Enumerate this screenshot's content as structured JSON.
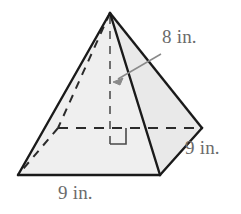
{
  "figure": {
    "type": "square-pyramid-diagram",
    "shape_name": "square pyramid",
    "fill_color": "#efefef",
    "edge_color": "#1a1a1a",
    "hidden_edge_color": "#2b2b2b",
    "label_color": "#6b6b6b",
    "background_color": "#ffffff"
  },
  "labels": {
    "height": "8 in.",
    "base_side_right": "9 in.",
    "base_side_bottom": "9 in."
  },
  "annotations": {
    "right_angle_marker": true,
    "height_leader_arrow": true
  },
  "geometry": {
    "apex": [
      110,
      13
    ],
    "front_left_base": [
      18,
      175
    ],
    "front_right_base": [
      160,
      175
    ],
    "right_base": [
      202,
      128
    ],
    "back_left_base_hidden": [
      58,
      128
    ],
    "base_center": [
      110,
      128
    ],
    "height_line": [
      [
        110,
        13
      ],
      [
        110,
        128
      ]
    ],
    "arrow_tail": [
      160,
      55
    ],
    "arrow_head": [
      115,
      82
    ]
  }
}
